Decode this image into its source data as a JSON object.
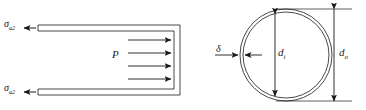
{
  "figure": {
    "background_color": "#ffffff",
    "line_color": "#1a1a1a"
  },
  "longitudinal_view": {
    "name": "longitudinal-section-view",
    "axial_stress_top": {
      "symbol": "σ",
      "subscript": "a2"
    },
    "axial_stress_bottom": {
      "symbol": "σ",
      "subscript": "a2"
    },
    "internal_pressure": {
      "symbol": "P"
    },
    "pressure_arrow_count": 4,
    "wall_count": 2
  },
  "cross_section_view": {
    "name": "circular-cross-section-view",
    "wall_thickness": {
      "symbol": "δ"
    },
    "inner_diameter": {
      "symbol": "d",
      "subscript": "i"
    },
    "outer_diameter": {
      "symbol": "d",
      "subscript": "o"
    }
  }
}
